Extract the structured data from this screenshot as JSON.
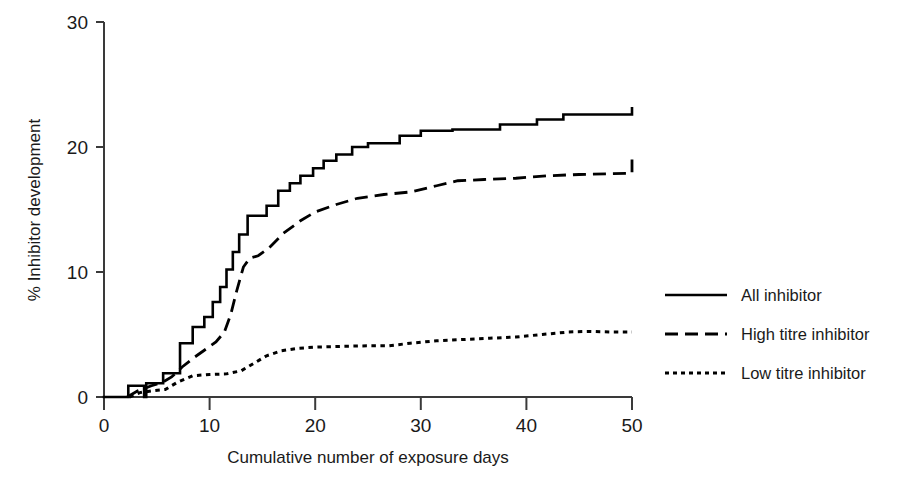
{
  "chart_data": {
    "type": "line",
    "title": "",
    "xlabel": "Cumulative number of exposure days",
    "ylabel": "% Inhibitor development",
    "xlim": [
      0,
      50
    ],
    "ylim": [
      0,
      30
    ],
    "xticks": [
      0,
      10,
      20,
      30,
      40,
      50
    ],
    "yticks": [
      0,
      10,
      20,
      30
    ],
    "grid": false,
    "legend_position": "right",
    "curve_style": "cumulative incidence / step function",
    "series": [
      {
        "name": "All inhibitor",
        "style": "solid",
        "color": "#000000",
        "step": true,
        "points": [
          [
            0,
            0
          ],
          [
            2.3,
            0
          ],
          [
            2.3,
            0.9
          ],
          [
            3.8,
            0.9
          ],
          [
            3.8,
            0.0
          ],
          [
            4.0,
            0.0
          ],
          [
            4.0,
            1.1
          ],
          [
            5.6,
            1.1
          ],
          [
            5.6,
            1.9
          ],
          [
            7.2,
            1.9
          ],
          [
            7.2,
            4.3
          ],
          [
            8.4,
            4.3
          ],
          [
            8.4,
            5.6
          ],
          [
            9.5,
            5.6
          ],
          [
            9.5,
            6.4
          ],
          [
            10.3,
            6.4
          ],
          [
            10.3,
            7.6
          ],
          [
            11.0,
            7.6
          ],
          [
            11.0,
            8.8
          ],
          [
            11.6,
            8.8
          ],
          [
            11.6,
            10.2
          ],
          [
            12.2,
            10.2
          ],
          [
            12.2,
            11.6
          ],
          [
            12.8,
            11.6
          ],
          [
            12.8,
            13.0
          ],
          [
            13.6,
            13.0
          ],
          [
            13.6,
            14.5
          ],
          [
            15.4,
            14.5
          ],
          [
            15.4,
            15.3
          ],
          [
            16.5,
            15.3
          ],
          [
            16.5,
            16.5
          ],
          [
            17.6,
            16.5
          ],
          [
            17.6,
            17.1
          ],
          [
            18.6,
            17.1
          ],
          [
            18.6,
            17.7
          ],
          [
            19.8,
            17.7
          ],
          [
            19.8,
            18.3
          ],
          [
            20.8,
            18.3
          ],
          [
            20.8,
            18.9
          ],
          [
            22.0,
            18.9
          ],
          [
            22.0,
            19.4
          ],
          [
            23.5,
            19.4
          ],
          [
            23.5,
            20.0
          ],
          [
            25.0,
            20.0
          ],
          [
            25.0,
            20.3
          ],
          [
            28.0,
            20.3
          ],
          [
            28.0,
            20.9
          ],
          [
            30.0,
            20.9
          ],
          [
            30.0,
            21.3
          ],
          [
            33.0,
            21.3
          ],
          [
            33.0,
            21.4
          ],
          [
            37.5,
            21.4
          ],
          [
            37.5,
            21.8
          ],
          [
            41.0,
            21.8
          ],
          [
            41.0,
            22.2
          ],
          [
            43.5,
            22.2
          ],
          [
            43.5,
            22.6
          ],
          [
            50.0,
            22.6
          ],
          [
            50.0,
            23.1
          ]
        ],
        "final_value": 23.1
      },
      {
        "name": "High titre inhibitor",
        "style": "dashed",
        "color": "#000000",
        "step": false,
        "points": [
          [
            2.2,
            0
          ],
          [
            3.2,
            0.5
          ],
          [
            4.5,
            0.9
          ],
          [
            5.6,
            1.2
          ],
          [
            6.4,
            1.6
          ],
          [
            7.4,
            2.4
          ],
          [
            8.6,
            3.2
          ],
          [
            9.6,
            3.8
          ],
          [
            10.6,
            4.4
          ],
          [
            11.4,
            5.2
          ],
          [
            12.0,
            6.6
          ],
          [
            12.6,
            8.6
          ],
          [
            13.2,
            10.4
          ],
          [
            13.8,
            11.1
          ],
          [
            14.6,
            11.3
          ],
          [
            15.6,
            11.9
          ],
          [
            17.0,
            13.1
          ],
          [
            18.6,
            14.1
          ],
          [
            20.0,
            14.8
          ],
          [
            22.0,
            15.4
          ],
          [
            24.0,
            15.9
          ],
          [
            26.5,
            16.2
          ],
          [
            29.0,
            16.4
          ],
          [
            31.5,
            16.9
          ],
          [
            33.5,
            17.3
          ],
          [
            36.0,
            17.4
          ],
          [
            39.0,
            17.5
          ],
          [
            42.0,
            17.7
          ],
          [
            45.0,
            17.8
          ],
          [
            50.0,
            17.9
          ],
          [
            50.0,
            19.0
          ]
        ],
        "final_value": 19.0
      },
      {
        "name": "Low titre inhibitor",
        "style": "dotted",
        "color": "#000000",
        "step": false,
        "points": [
          [
            2.4,
            0
          ],
          [
            3.4,
            0.35
          ],
          [
            4.6,
            0.5
          ],
          [
            5.8,
            0.6
          ],
          [
            7.0,
            1.2
          ],
          [
            8.4,
            1.7
          ],
          [
            10.0,
            1.8
          ],
          [
            11.6,
            1.85
          ],
          [
            13.0,
            2.1
          ],
          [
            14.2,
            2.7
          ],
          [
            15.4,
            3.3
          ],
          [
            16.8,
            3.7
          ],
          [
            18.4,
            3.9
          ],
          [
            20.2,
            4.0
          ],
          [
            22.5,
            4.05
          ],
          [
            25.0,
            4.1
          ],
          [
            27.0,
            4.1
          ],
          [
            29.0,
            4.3
          ],
          [
            31.5,
            4.5
          ],
          [
            34.0,
            4.6
          ],
          [
            36.5,
            4.7
          ],
          [
            39.0,
            4.8
          ],
          [
            41.5,
            5.0
          ],
          [
            44.0,
            5.2
          ],
          [
            46.0,
            5.25
          ],
          [
            48.0,
            5.2
          ],
          [
            50.0,
            5.2
          ]
        ],
        "final_value": 5.2
      }
    ]
  },
  "axes": {
    "y_title": "% Inhibitor development",
    "x_title": "Cumulative number of exposure days",
    "y_tick_labels": [
      "0",
      "10",
      "20",
      "30"
    ],
    "x_tick_labels": [
      "0",
      "10",
      "20",
      "30",
      "40",
      "50"
    ]
  },
  "legend": {
    "items": [
      {
        "label": "All inhibitor",
        "style": "solid"
      },
      {
        "label": "High titre inhibitor",
        "style": "dashed"
      },
      {
        "label": "Low titre inhibitor",
        "style": "dotted"
      }
    ]
  },
  "colors": {
    "ink": "#1a1a1a",
    "line": "#000000",
    "background": "#ffffff"
  }
}
